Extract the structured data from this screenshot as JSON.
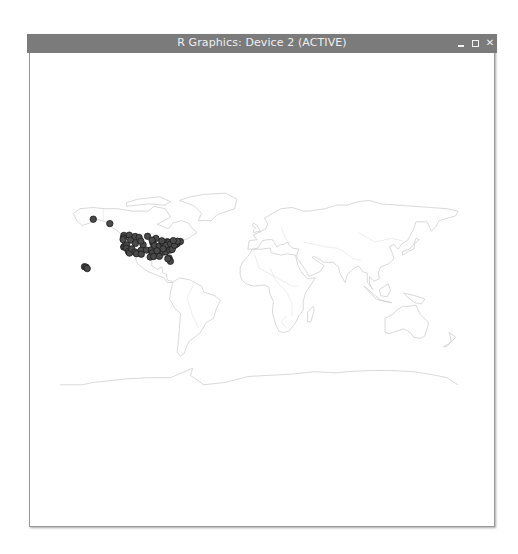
{
  "window": {
    "title": "R Graphics: Device 2 (ACTIVE)",
    "controls": {
      "minimize": "minimize",
      "maximize": "maximize",
      "close": "close"
    }
  },
  "chart_data": {
    "type": "scatter",
    "title": "",
    "xlabel": "",
    "ylabel": "",
    "basemap": "world country outlines",
    "xlim": [
      -180,
      180
    ],
    "ylim": [
      -90,
      90
    ],
    "point_style": {
      "fill": "#4a4a4a",
      "stroke": "#1a1a1a"
    },
    "map_style": {
      "stroke": "#c8c8c8"
    },
    "points": [
      {
        "lon": -150,
        "lat": 61.2
      },
      {
        "lon": -135,
        "lat": 57.5
      },
      {
        "lon": -157.9,
        "lat": 21.3
      },
      {
        "lon": -156.5,
        "lat": 20.8
      },
      {
        "lon": -155.5,
        "lat": 19.7
      },
      {
        "lon": -122.3,
        "lat": 47.6
      },
      {
        "lon": -117.4,
        "lat": 47.7
      },
      {
        "lon": -122.7,
        "lat": 45.5
      },
      {
        "lon": -116.2,
        "lat": 43.6
      },
      {
        "lon": -112.0,
        "lat": 46.6
      },
      {
        "lon": -123.0,
        "lat": 44.0
      },
      {
        "lon": -122.4,
        "lat": 37.8
      },
      {
        "lon": -121.5,
        "lat": 38.6
      },
      {
        "lon": -119.8,
        "lat": 39.5
      },
      {
        "lon": -119.8,
        "lat": 36.7
      },
      {
        "lon": -118.2,
        "lat": 34.1
      },
      {
        "lon": -117.2,
        "lat": 32.7
      },
      {
        "lon": -115.1,
        "lat": 36.2
      },
      {
        "lon": -111.9,
        "lat": 40.8
      },
      {
        "lon": -112.1,
        "lat": 33.5
      },
      {
        "lon": -110.9,
        "lat": 32.2
      },
      {
        "lon": -108.5,
        "lat": 45.8
      },
      {
        "lon": -104.9,
        "lat": 39.7
      },
      {
        "lon": -106.6,
        "lat": 35.1
      },
      {
        "lon": -106.5,
        "lat": 31.8
      },
      {
        "lon": -107.0,
        "lat": 42.8
      },
      {
        "lon": -101.8,
        "lat": 35.2
      },
      {
        "lon": -97.5,
        "lat": 35.5
      },
      {
        "lon": -96.8,
        "lat": 32.8
      },
      {
        "lon": -98.5,
        "lat": 29.4
      },
      {
        "lon": -95.4,
        "lat": 29.8
      },
      {
        "lon": -96.0,
        "lat": 41.3
      },
      {
        "lon": -94.6,
        "lat": 39.1
      },
      {
        "lon": -93.3,
        "lat": 45.0
      },
      {
        "lon": -90.2,
        "lat": 38.6
      },
      {
        "lon": -87.6,
        "lat": 41.9
      },
      {
        "lon": -90.1,
        "lat": 30.0
      },
      {
        "lon": -86.8,
        "lat": 33.5
      },
      {
        "lon": -86.2,
        "lat": 39.8
      },
      {
        "lon": -84.4,
        "lat": 33.7
      },
      {
        "lon": -83.0,
        "lat": 42.3
      },
      {
        "lon": -81.7,
        "lat": 41.5
      },
      {
        "lon": -84.5,
        "lat": 39.1
      },
      {
        "lon": -86.8,
        "lat": 36.2
      },
      {
        "lon": -80.8,
        "lat": 35.2
      },
      {
        "lon": -81.4,
        "lat": 28.5
      },
      {
        "lon": -80.2,
        "lat": 25.8
      },
      {
        "lon": -82.5,
        "lat": 27.9
      },
      {
        "lon": -77.0,
        "lat": 38.9
      },
      {
        "lon": -75.2,
        "lat": 40.0
      },
      {
        "lon": -74.0,
        "lat": 40.7
      },
      {
        "lon": -71.1,
        "lat": 42.4
      },
      {
        "lon": -79.9,
        "lat": 40.4
      },
      {
        "lon": -78.6,
        "lat": 35.8
      },
      {
        "lon": -76.6,
        "lat": 39.3
      },
      {
        "lon": -73.8,
        "lat": 42.7
      },
      {
        "lon": -77.6,
        "lat": 43.2
      },
      {
        "lon": -88.0,
        "lat": 43.0
      },
      {
        "lon": -92.3,
        "lat": 34.7
      },
      {
        "lon": -100.8,
        "lat": 46.8
      },
      {
        "lon": -96.7,
        "lat": 43.5
      }
    ]
  }
}
